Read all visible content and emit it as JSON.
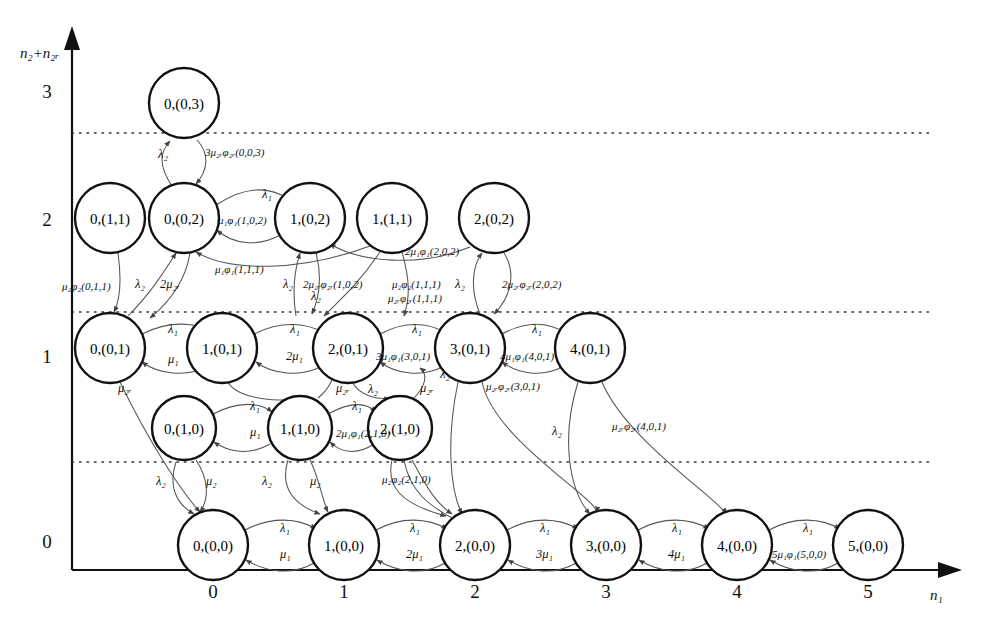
{
  "figure": {
    "type": "state-transition-diagram",
    "axes": {
      "y_label": "n₂+n₂ᵣ",
      "x_label": "n₁",
      "y_ticks": [
        "0",
        "1",
        "2",
        "3"
      ],
      "x_ticks": [
        "0",
        "1",
        "2",
        "3",
        "4",
        "5"
      ]
    },
    "nodes": [
      {
        "id": "0-0-3",
        "label": "0,(0,3)",
        "x": 184,
        "y": 103,
        "r": 35
      },
      {
        "id": "0-1-1",
        "label": "0,(1,1)",
        "x": 110,
        "y": 218,
        "r": 35
      },
      {
        "id": "0-0-2",
        "label": "0,(0,2)",
        "x": 184,
        "y": 218,
        "r": 35
      },
      {
        "id": "1-0-2",
        "label": "1,(0,2)",
        "x": 310,
        "y": 218,
        "r": 35
      },
      {
        "id": "1-1-1",
        "label": "1,(1,1)",
        "x": 392,
        "y": 218,
        "r": 35
      },
      {
        "id": "2-0-2",
        "label": "2,(0,2)",
        "x": 494,
        "y": 218,
        "r": 35
      },
      {
        "id": "0-0-1",
        "label": "0,(0,1)",
        "x": 110,
        "y": 348,
        "r": 35
      },
      {
        "id": "1-0-1",
        "label": "1,(0,1)",
        "x": 222,
        "y": 348,
        "r": 35
      },
      {
        "id": "2-0-1",
        "label": "2,(0,1)",
        "x": 348,
        "y": 348,
        "r": 35
      },
      {
        "id": "3-0-1",
        "label": "3,(0,1)",
        "x": 470,
        "y": 348,
        "r": 35
      },
      {
        "id": "4-0-1",
        "label": "4,(0,1)",
        "x": 590,
        "y": 348,
        "r": 35
      },
      {
        "id": "0-1-0",
        "label": "0,(1,0)",
        "x": 184,
        "y": 428,
        "r": 32
      },
      {
        "id": "1-1-0",
        "label": "1,(1,0)",
        "x": 300,
        "y": 428,
        "r": 32
      },
      {
        "id": "2-1-0",
        "label": "2,(1,0)",
        "x": 400,
        "y": 428,
        "r": 32
      },
      {
        "id": "0-0-0",
        "label": "0,(0,0)",
        "x": 213,
        "y": 545,
        "r": 35
      },
      {
        "id": "1-0-0",
        "label": "1,(0,0)",
        "x": 344,
        "y": 545,
        "r": 35
      },
      {
        "id": "2-0-0",
        "label": "2,(0,0)",
        "x": 475,
        "y": 545,
        "r": 35
      },
      {
        "id": "3-0-0",
        "label": "3,(0,0)",
        "x": 606,
        "y": 545,
        "r": 35
      },
      {
        "id": "4-0-0",
        "label": "4,(0,0)",
        "x": 737,
        "y": 545,
        "r": 35
      },
      {
        "id": "5-0-0",
        "label": "5,(0,0)",
        "x": 868,
        "y": 545,
        "r": 35
      }
    ],
    "edge_labels": [
      {
        "id": "l1",
        "text": "λ₂",
        "x": 158,
        "y": 158
      },
      {
        "id": "l2",
        "text": "3μ₂ᵣφ₂ᵣ(0,0,3)",
        "x": 205,
        "y": 156
      },
      {
        "id": "l3",
        "text": "λ₁",
        "x": 262,
        "y": 198
      },
      {
        "id": "l4",
        "text": "μ₁φ₁(1,0,2)",
        "x": 218,
        "y": 224
      },
      {
        "id": "l5",
        "text": "2μ₁φ₁(2,0,2)",
        "x": 405,
        "y": 255
      },
      {
        "id": "l6",
        "text": "μ₂φ₂(0,1,1)",
        "x": 62,
        "y": 290
      },
      {
        "id": "l7",
        "text": "λ₂",
        "x": 135,
        "y": 288
      },
      {
        "id": "l8",
        "text": "2μ₂ᵣ",
        "x": 160,
        "y": 288
      },
      {
        "id": "l9",
        "text": "μ₁φ₁(1,1,1)",
        "x": 215,
        "y": 273
      },
      {
        "id": "l10",
        "text": "λ₂",
        "x": 283,
        "y": 288
      },
      {
        "id": "l11",
        "text": "2μ₂ᵣφ₂ᵣ(1,0,2)",
        "x": 303,
        "y": 288
      },
      {
        "id": "l12",
        "text": "λ₂",
        "x": 311,
        "y": 300
      },
      {
        "id": "l13",
        "text": "μ₂φ₂(1,1,1)",
        "x": 392,
        "y": 288
      },
      {
        "id": "l14",
        "text": "λ₂",
        "x": 455,
        "y": 288
      },
      {
        "id": "l15",
        "text": "μ₂ᵣφ₂ᵣ(1,1,1)",
        "x": 388,
        "y": 302
      },
      {
        "id": "l16",
        "text": "2μ₂ᵣφ₂ᵣ(2,0,2)",
        "x": 502,
        "y": 288
      },
      {
        "id": "l17",
        "text": "λ₁",
        "x": 168,
        "y": 333
      },
      {
        "id": "l18",
        "text": "μ₁",
        "x": 168,
        "y": 363
      },
      {
        "id": "l19",
        "text": "λ₁",
        "x": 290,
        "y": 333
      },
      {
        "id": "l20",
        "text": "2μ₁",
        "x": 286,
        "y": 360
      },
      {
        "id": "l21",
        "text": "λ₁",
        "x": 412,
        "y": 333
      },
      {
        "id": "l22",
        "text": "3μ₁φ₁(3,0,1)",
        "x": 376,
        "y": 360
      },
      {
        "id": "l23",
        "text": "λ₁",
        "x": 532,
        "y": 333
      },
      {
        "id": "l24",
        "text": "4μ₁φ₁(4,0,1)",
        "x": 500,
        "y": 360
      },
      {
        "id": "l25",
        "text": "μ₂ᵣ",
        "x": 118,
        "y": 392
      },
      {
        "id": "l26",
        "text": "μ₂ᵣ",
        "x": 336,
        "y": 392
      },
      {
        "id": "l27",
        "text": "λ₂",
        "x": 368,
        "y": 393
      },
      {
        "id": "l28",
        "text": "μ₂ᵣ",
        "x": 420,
        "y": 392
      },
      {
        "id": "l29",
        "text": "λ₂",
        "x": 440,
        "y": 378
      },
      {
        "id": "l30",
        "text": "μ₂ᵣφ₂ᵣ(3,0,1)",
        "x": 486,
        "y": 390
      },
      {
        "id": "l31",
        "text": "λ₁",
        "x": 250,
        "y": 410
      },
      {
        "id": "l32",
        "text": "μ₁",
        "x": 250,
        "y": 436
      },
      {
        "id": "l33",
        "text": "λ₁",
        "x": 352,
        "y": 410
      },
      {
        "id": "l34",
        "text": "2μ₁φ₁(2,1,0)",
        "x": 336,
        "y": 437
      },
      {
        "id": "l35",
        "text": "λ₂",
        "x": 552,
        "y": 435
      },
      {
        "id": "l36",
        "text": "μ₂ᵣφ₂ᵣ(4,0,1)",
        "x": 612,
        "y": 430
      },
      {
        "id": "l37",
        "text": "λ₂",
        "x": 156,
        "y": 485
      },
      {
        "id": "l38",
        "text": "μ₂",
        "x": 206,
        "y": 485
      },
      {
        "id": "l39",
        "text": "λ₂",
        "x": 262,
        "y": 485
      },
      {
        "id": "l40",
        "text": "μ₂",
        "x": 310,
        "y": 485
      },
      {
        "id": "l41",
        "text": "μ₂φ₂(2,1,0)",
        "x": 382,
        "y": 483
      },
      {
        "id": "l42",
        "text": "λ₁",
        "x": 280,
        "y": 532
      },
      {
        "id": "l43",
        "text": "μ₁",
        "x": 280,
        "y": 558
      },
      {
        "id": "l44",
        "text": "λ₁",
        "x": 410,
        "y": 532
      },
      {
        "id": "l45",
        "text": "2μ₁",
        "x": 406,
        "y": 558
      },
      {
        "id": "l46",
        "text": "λ₁",
        "x": 540,
        "y": 532
      },
      {
        "id": "l47",
        "text": "3μ₁",
        "x": 536,
        "y": 558
      },
      {
        "id": "l48",
        "text": "λ₁",
        "x": 672,
        "y": 532
      },
      {
        "id": "l49",
        "text": "4μ₁",
        "x": 668,
        "y": 558
      },
      {
        "id": "l50",
        "text": "λ₁",
        "x": 803,
        "y": 532
      },
      {
        "id": "l51",
        "text": "5μ₁φ₁(5,0,0)",
        "x": 772,
        "y": 558
      }
    ]
  }
}
